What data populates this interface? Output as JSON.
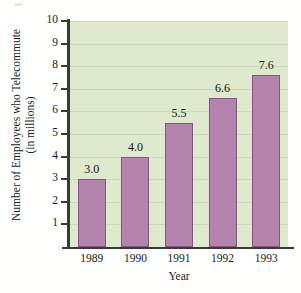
{
  "chart_data": {
    "type": "bar",
    "title": "",
    "categories": [
      "1989",
      "1990",
      "1991",
      "1992",
      "1993"
    ],
    "values": [
      3.0,
      4.0,
      5.5,
      6.6,
      7.6
    ],
    "value_labels": [
      "3.0",
      "4.0",
      "5.5",
      "6.6",
      "7.6"
    ],
    "xlabel": "Year",
    "ylabel_line1": "Number of Employees who Telecommute",
    "ylabel_line2": "(in millions)",
    "ylim": [
      0,
      10
    ],
    "ytick_labels": [
      "1",
      "2",
      "3",
      "4",
      "5",
      "6",
      "7",
      "8",
      "9",
      "10"
    ],
    "ytick_values": [
      1,
      2,
      3,
      4,
      5,
      6,
      7,
      8,
      9,
      10
    ],
    "grid": true,
    "legend": "none",
    "colors": {
      "bar_fill": "#b584ae",
      "bar_outline": "#7d5878",
      "plot_background": "#dee9cd",
      "gridline": "#cbd9bb",
      "axis": "#3a3a38",
      "page_background": "#fefefc",
      "text": "#1b1b1b"
    }
  }
}
